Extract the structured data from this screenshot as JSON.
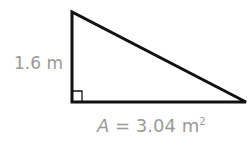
{
  "diagram": {
    "shape": "right-triangle",
    "height_label": "1.6 m",
    "area": {
      "variable": "A",
      "equals": " = 3.04 m",
      "exponent": "2"
    },
    "right_angle_marker": true,
    "colors": {
      "stroke": "#111111",
      "label": "#9a9a9a"
    }
  }
}
